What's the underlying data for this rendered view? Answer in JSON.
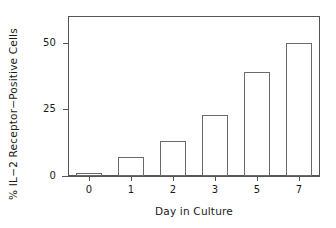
{
  "chart_data": {
    "type": "bar",
    "title": "",
    "categories": [
      "0",
      "1",
      "2",
      "3",
      "5",
      "7"
    ],
    "values": [
      1,
      7,
      13,
      23,
      39,
      50
    ],
    "xlabel": "Day in Culture",
    "ylabel": "% IL−2 Receptor−Positive Cells",
    "ylim": [
      0,
      60
    ],
    "yticks": [
      0,
      25,
      50
    ],
    "ytick_labels": [
      "0",
      "25",
      "50"
    ],
    "xtick_labels": [
      "0",
      "1",
      "2",
      "3",
      "5",
      "7"
    ],
    "grid": false,
    "legend": null,
    "bar_facecolor": "#ffffff",
    "bar_edgecolor": "#6a6a6a",
    "axis_color": "#555555"
  },
  "axes": {
    "ylabel": "% IL−2 Receptor−Positive Cells",
    "xlabel": "Day in Culture",
    "ytick_0": "0",
    "ytick_1": "25",
    "ytick_2": "50",
    "xtick_0": "0",
    "xtick_1": "1",
    "xtick_2": "2",
    "xtick_3": "3",
    "xtick_4": "5",
    "xtick_5": "7"
  }
}
